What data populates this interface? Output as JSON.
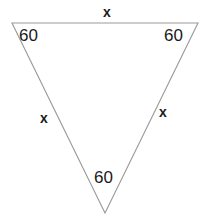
{
  "figure": {
    "name": "triangle-diagram",
    "stroke_color": "#999999",
    "fill_color": "#ffffff",
    "text_color": "#1a1a1a",
    "background_color": "#ffffff",
    "vertices": {
      "top_left": {
        "x": 12,
        "y": 23
      },
      "top_right": {
        "x": 198,
        "y": 23
      },
      "bottom": {
        "x": 105,
        "y": 213
      }
    },
    "angles": [
      {
        "id": "top-left",
        "value": "60"
      },
      {
        "id": "top-right",
        "value": "60"
      },
      {
        "id": "bottom",
        "value": "60"
      }
    ],
    "sides": [
      {
        "id": "top",
        "value": "x"
      },
      {
        "id": "left",
        "value": "x"
      },
      {
        "id": "right",
        "value": "x"
      }
    ]
  }
}
